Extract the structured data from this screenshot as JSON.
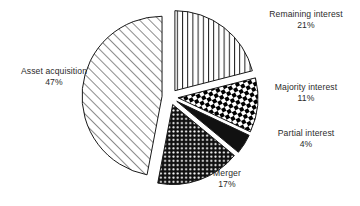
{
  "chart_data": {
    "type": "pie",
    "title": "",
    "subtitle": "",
    "xlabel": "",
    "ylabel": "",
    "legend_position": "none",
    "grid": false,
    "exploded": true,
    "units": "%",
    "categories": [
      "Asset acquisition",
      "Remaining interest",
      "Majority interest",
      "Partial interest",
      "Merger"
    ],
    "values": [
      47,
      21,
      11,
      4,
      17
    ],
    "slices": [
      {
        "label": "Asset acquisition",
        "value": 47,
        "value_text": "47%",
        "pattern": "diagonal-hatch",
        "fill": "#ffffff",
        "stroke": "#1a1a1a",
        "start_angle": 190.8,
        "end_angle": 360.0
      },
      {
        "label": "Remaining interest",
        "value": 21,
        "value_text": "21%",
        "pattern": "vertical-lines",
        "fill": "#ffffff",
        "stroke": "#1a1a1a",
        "start_angle": 0.0,
        "end_angle": 75.6
      },
      {
        "label": "Majority interest",
        "value": 11,
        "value_text": "11%",
        "pattern": "checkerboard",
        "fill": "#000000",
        "stroke": "#1a1a1a",
        "start_angle": 75.6,
        "end_angle": 115.2
      },
      {
        "label": "Partial interest",
        "value": 4,
        "value_text": "4%",
        "pattern": "solid-black",
        "fill": "#111111",
        "stroke": "#1a1a1a",
        "start_angle": 115.2,
        "end_angle": 129.6
      },
      {
        "label": "Merger",
        "value": 17,
        "value_text": "17%",
        "pattern": "stipple-dots",
        "fill": "#111111",
        "stroke": "#1a1a1a",
        "start_angle": 129.6,
        "end_angle": 190.8
      }
    ],
    "colors": {
      "background": "#ffffff",
      "outline": "#1a1a1a",
      "text": "#2b2b2b"
    }
  }
}
